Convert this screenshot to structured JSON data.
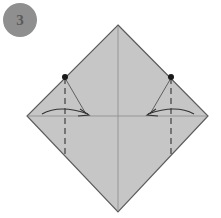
{
  "step": {
    "number": "3"
  },
  "colors": {
    "paper": "#c6c6c6",
    "outline": "#5c5c5c",
    "crease": "#8a8a8a",
    "badge": "#8f8f8f",
    "badge_text": "#5a5a5a",
    "marks": "#333333"
  },
  "diagram": {
    "shape": "square-rotated-45",
    "vertices": {
      "top": [
        118,
        25
      ],
      "right": [
        208,
        116
      ],
      "bottom": [
        118,
        212
      ],
      "left": [
        27,
        116
      ]
    },
    "creases": [
      "vertical-center",
      "horizontal-center"
    ],
    "left_fold": {
      "dot": [
        65,
        77
      ],
      "valley_line_x": 65,
      "arrow": "curved-toward-center"
    },
    "right_fold": {
      "dot": [
        171,
        77
      ],
      "valley_line_x": 171,
      "arrow": "curved-toward-center"
    }
  }
}
